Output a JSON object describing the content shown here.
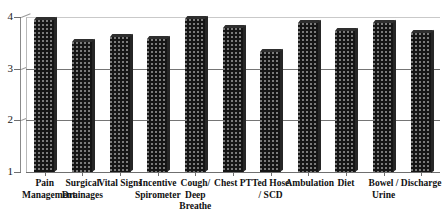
{
  "chart_data": {
    "type": "bar",
    "title": "",
    "subtitle": "",
    "xlabel": "",
    "ylabel": "",
    "ylim": [
      1,
      4
    ],
    "yticks": [
      1,
      2,
      3,
      4
    ],
    "ytick_labels": [
      "1",
      "2",
      "3",
      "4"
    ],
    "grid": true,
    "grid_axis": "y",
    "legend": false,
    "legend_position": "none",
    "bar_color": "#151515",
    "bar_style": "dotted-texture-3d",
    "categories": [
      "Pain\nManagement",
      "Surgical\nDrainages",
      "Vital Signs",
      "Incentive\nSpirometer",
      "Cough/\nDeep\nBreathe",
      "Chest PT",
      "Ted Hose\n/ SCD",
      "Ambulation",
      "Diet",
      "Bowel /\nUrine",
      "Discharge"
    ],
    "values": [
      3.95,
      3.51,
      3.62,
      3.58,
      3.97,
      3.78,
      3.32,
      3.88,
      3.72,
      3.88,
      3.7
    ]
  },
  "axes": {
    "y_ticks": [
      {
        "label": "4",
        "value": 4
      },
      {
        "label": "3",
        "value": 3
      },
      {
        "label": "2",
        "value": 2
      },
      {
        "label": "1",
        "value": 1
      }
    ]
  }
}
